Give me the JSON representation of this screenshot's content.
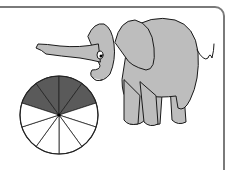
{
  "chart_data": {
    "type": "pie",
    "title": "",
    "total_slices": 10,
    "shaded_slices": 4,
    "fraction_shaded": 0.4,
    "slices": [
      {
        "index": 0,
        "shaded": true
      },
      {
        "index": 1,
        "shaded": true
      },
      {
        "index": 2,
        "shaded": true
      },
      {
        "index": 3,
        "shaded": true
      },
      {
        "index": 4,
        "shaded": false
      },
      {
        "index": 5,
        "shaded": false
      },
      {
        "index": 6,
        "shaded": false
      },
      {
        "index": 7,
        "shaded": false
      },
      {
        "index": 8,
        "shaded": false
      },
      {
        "index": 9,
        "shaded": false
      }
    ],
    "colors": {
      "shaded": "#5a5a5a",
      "unshaded": "#ffffff",
      "stroke": "#222222"
    }
  },
  "colors": {
    "elephant_fill": "#bdbdbd",
    "elephant_stroke": "#1a1a1a",
    "frame": "#7a7a7a"
  }
}
